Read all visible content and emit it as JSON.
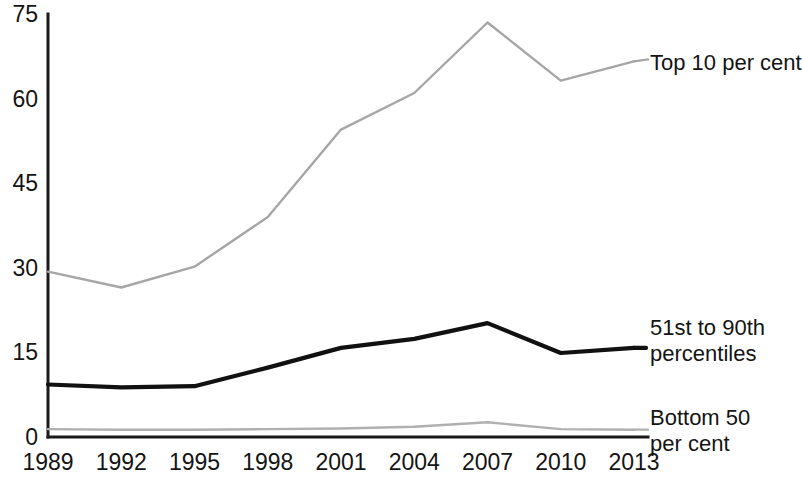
{
  "chart_data": {
    "type": "line",
    "title": "",
    "subtitle": "",
    "xlabel": "",
    "ylabel": "",
    "grid": false,
    "legend_position": "right-inline",
    "categories": [
      "1989",
      "1992",
      "1995",
      "1998",
      "2001",
      "2004",
      "2007",
      "2010",
      "2013"
    ],
    "x_tick_labels": [
      "1989",
      "1992",
      "1995",
      "1998",
      "2001",
      "2004",
      "2007",
      "2010",
      "2013"
    ],
    "y_tick_labels": [
      "75",
      "60",
      "45",
      "30",
      "15",
      "0"
    ],
    "y_ticks": [
      75,
      60,
      45,
      30,
      15,
      0
    ],
    "ylim": [
      0,
      75
    ],
    "series": [
      {
        "name": "Top 10 per cent",
        "color": "#a6a6a6",
        "values": [
          29.3,
          26.5,
          30.2,
          39.0,
          54.5,
          61.0,
          73.5,
          63.2,
          66.6
        ]
      },
      {
        "name": "51st to 90th percentiles",
        "color": "#111111",
        "values": [
          9.3,
          8.8,
          9.0,
          12.3,
          15.8,
          17.4,
          20.2,
          14.9,
          15.8
        ]
      },
      {
        "name": "Bottom 50 per cent",
        "color": "#b0b0b0",
        "values": [
          1.4,
          1.3,
          1.3,
          1.4,
          1.5,
          1.8,
          2.6,
          1.4,
          1.3
        ]
      }
    ]
  },
  "labels": {
    "top10": "Top 10 per cent",
    "mid_line1": "51st to 90th",
    "mid_line2": "percentiles",
    "bottom_line1": "Bottom 50",
    "bottom_line2": "per cent"
  }
}
